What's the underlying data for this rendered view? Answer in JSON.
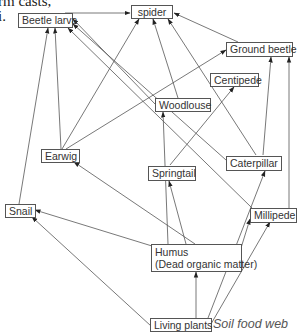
{
  "page_fragment": {
    "line1": "rm casts,",
    "line2": "i."
  },
  "diagram": {
    "caption": "Soil food web",
    "nodes": {
      "spider": "spider",
      "beetle_larva": "Beetle larva",
      "ground_beetle": "Ground beetle",
      "centipede": "Centipede",
      "woodlouse": "Woodlouse",
      "earwig": "Earwig",
      "springtail": "Springtail",
      "caterpillar": "Caterpillar",
      "snail": "Snail",
      "millipede": "Millipede",
      "humus_line1": "Humus",
      "humus_line2": "(Dead organic matter)",
      "living_plants": "Living plants"
    },
    "edges": [
      {
        "from": "Beetle larva",
        "to": "spider"
      },
      {
        "from": "Ground beetle",
        "to": "spider"
      },
      {
        "from": "Earwig",
        "to": "spider"
      },
      {
        "from": "Woodlouse",
        "to": "spider"
      },
      {
        "from": "Caterpillar",
        "to": "spider"
      },
      {
        "from": "Earwig",
        "to": "Ground beetle"
      },
      {
        "from": "Snail",
        "to": "Beetle larva"
      },
      {
        "from": "Earwig",
        "to": "Beetle larva"
      },
      {
        "from": "Woodlouse",
        "to": "Beetle larva"
      },
      {
        "from": "Caterpillar",
        "to": "Beetle larva"
      },
      {
        "from": "Millipede",
        "to": "Beetle larva"
      },
      {
        "from": "Caterpillar",
        "to": "Ground beetle"
      },
      {
        "from": "Millipede",
        "to": "Ground beetle"
      },
      {
        "from": "Springtail",
        "to": "Centipede"
      },
      {
        "from": "Humus (Dead organic matter)",
        "to": "Woodlouse"
      },
      {
        "from": "Humus (Dead organic matter)",
        "to": "Earwig"
      },
      {
        "from": "Humus (Dead organic matter)",
        "to": "Springtail"
      },
      {
        "from": "Humus (Dead organic matter)",
        "to": "Snail"
      },
      {
        "from": "Humus (Dead organic matter)",
        "to": "Millipede"
      },
      {
        "from": "Living plants",
        "to": "Snail"
      },
      {
        "from": "Living plants",
        "to": "Humus (Dead organic matter)"
      },
      {
        "from": "Living plants",
        "to": "Caterpillar"
      },
      {
        "from": "Living plants",
        "to": "Millipede"
      }
    ]
  }
}
